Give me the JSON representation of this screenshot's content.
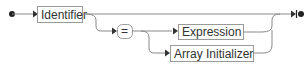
{
  "diagram": {
    "type": "railroad",
    "nodes": {
      "identifier": {
        "label": "Identifier",
        "kind": "nonterminal"
      },
      "equals": {
        "label": "=",
        "kind": "terminal"
      },
      "expression": {
        "label": "Expression",
        "kind": "nonterminal"
      },
      "array_initializer": {
        "label": "Array Initializer",
        "kind": "nonterminal"
      }
    },
    "colors": {
      "line": "#8a8a8a",
      "box_border": "#9a9a9a",
      "text": "#333333",
      "marker": "#222222"
    }
  }
}
